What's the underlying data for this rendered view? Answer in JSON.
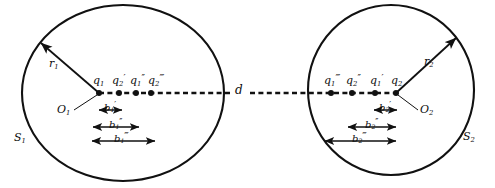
{
  "figure": {
    "kind": "two-sphere-image-charge-diagram",
    "background": "#ffffff",
    "stroke_color": "#111111",
    "width": 495,
    "height": 188
  },
  "spheres": [
    {
      "name": "left-sphere",
      "surface_label": "S",
      "surface_sub": "1",
      "center_label": "O",
      "center_sub": "1",
      "radius_label": "r",
      "radius_sub": "1",
      "cx": 123,
      "cy": 93,
      "rx": 101,
      "ry": 88
    },
    {
      "name": "right-sphere",
      "surface_label": "S",
      "surface_sub": "2",
      "center_label": "O",
      "center_sub": "2",
      "radius_label": "r",
      "radius_sub": "2",
      "cx": 391,
      "cy": 90,
      "rx": 83,
      "ry": 85
    }
  ],
  "separation": {
    "label": "d",
    "description": "center-to-center separation along horizontal dashed axis"
  },
  "axis": {
    "y": 93,
    "x_start": 22,
    "x_end": 474,
    "style": "dashed"
  },
  "charges_left": [
    {
      "base": "q",
      "sub": "1",
      "primes": "",
      "x": 99,
      "y": 93
    },
    {
      "base": "q",
      "sub": "2",
      "primes": "′",
      "x": 119,
      "y": 93
    },
    {
      "base": "q",
      "sub": "1",
      "primes": "″",
      "x": 136,
      "y": 93
    },
    {
      "base": "q",
      "sub": "2",
      "primes": "‴",
      "x": 151,
      "y": 93
    }
  ],
  "charges_right": [
    {
      "base": "q",
      "sub": "1",
      "primes": "‴",
      "x": 331,
      "y": 93
    },
    {
      "base": "q",
      "sub": "2",
      "primes": "″",
      "x": 352,
      "y": 93
    },
    {
      "base": "q",
      "sub": "1",
      "primes": "′",
      "x": 375,
      "y": 93
    },
    {
      "base": "q",
      "sub": "2",
      "primes": "",
      "x": 396,
      "y": 93
    }
  ],
  "dimensions_left": [
    {
      "base": "b",
      "sub": "1",
      "primes": "′",
      "x1": 99,
      "x2": 122,
      "y": 110
    },
    {
      "base": "b",
      "sub": "1",
      "primes": "″",
      "x1": 93,
      "x2": 139,
      "y": 127
    },
    {
      "base": "b",
      "sub": "1",
      "primes": "‴",
      "x1": 92,
      "x2": 155,
      "y": 141
    }
  ],
  "dimensions_right": [
    {
      "base": "b",
      "sub": "2",
      "primes": "′",
      "x1": 374,
      "x2": 397,
      "y": 110
    },
    {
      "base": "b",
      "sub": "2",
      "primes": "″",
      "x1": 348,
      "x2": 396,
      "y": 127
    },
    {
      "base": "b",
      "sub": "2",
      "primes": "‴",
      "x1": 325,
      "x2": 396,
      "y": 141
    }
  ],
  "labels": {
    "d": "d",
    "q": "q",
    "b": "b",
    "r": "r",
    "O": "O",
    "S": "S",
    "prime_single": "′",
    "prime_double": "″",
    "prime_triple": "‴",
    "one": "1",
    "two": "2"
  }
}
